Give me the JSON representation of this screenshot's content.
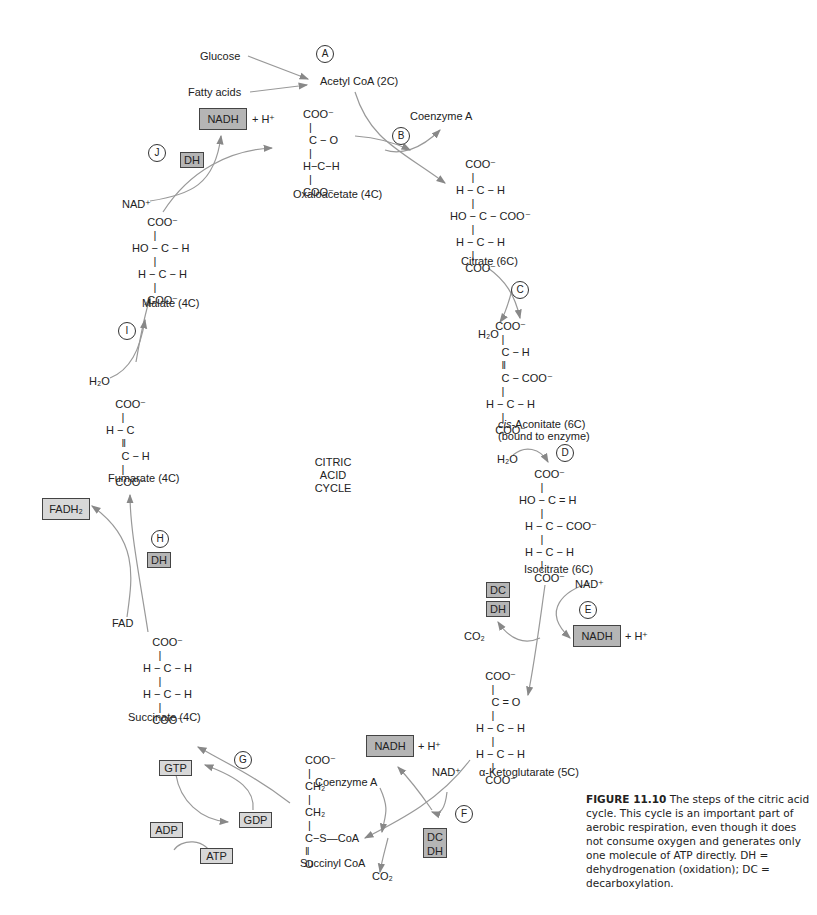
{
  "diagram": {
    "title": "CITRIC ACID CYCLE",
    "title_lines": [
      "CITRIC",
      "ACID",
      "CYCLE"
    ],
    "inputs": {
      "glucose": "Glucose",
      "fatty_acids": "Fatty acids"
    },
    "steps": [
      "A",
      "B",
      "C",
      "D",
      "E",
      "F",
      "G",
      "H",
      "I",
      "J"
    ],
    "molecules": {
      "acetyl_coa": "Acetyl CoA (2C)",
      "oxaloacetate": "Oxaloacetate (4C)",
      "citrate": "Citrate (6C)",
      "cis_aconitate": "-Aconitate (6C)",
      "cis_prefix": "cis",
      "cis_aconitate_note": "(bound to enzyme)",
      "isocitrate": "Isocitrate (6C)",
      "alpha_ketoglutarate": "α-Ketoglutarate (5C)",
      "succinyl_coa": "Succinyl CoA",
      "succinate": "Succinate (4C)",
      "fumarate": "Fumarate (4C)",
      "malate": "Malate (4C)"
    },
    "structures": {
      "oxaloacetate": "COO⁻\n  |\n  C − O\n  |\nH−C−H\n  |\nCOO⁻",
      "citrate": "     COO⁻\n       |\n  H − C − H\n       |\nHO − C − COO⁻\n       |\n  H − C − H\n       |\n     COO⁻",
      "cis_aconitate": "     COO⁻\n       |\n       C − H\n       ‖\n       C − COO⁻\n       |\n  H − C − H\n       |\n     COO⁻",
      "isocitrate": "     COO⁻\n       |\nHO − C = H\n       |\n  H − C − COO⁻\n       |\n  H − C − H\n       |\n     COO⁻",
      "alpha_ketoglutarate": "     COO⁻\n       |\n       C = O\n       |\n  H − C − H\n       |\n  H − C − H\n       |\n     COO⁻",
      "succinyl_coa": "COO⁻\n |\nCH₂\n |\nCH₂\n |\nC−S—CoA\n‖\nO",
      "succinate": "     COO⁻\n       |\n  H − C − H\n       |\n  H − C − H\n       |\n     COO⁻",
      "fumarate": "     COO⁻\n       |\n  H − C\n       ‖\n       C − H\n       |\n     COO⁻",
      "malate": "     COO⁻\n       |\nHO − C − H\n       |\n  H − C − H\n       |\n     COO⁻"
    },
    "cofactors": {
      "coenzyme_a_top": "Coenzyme A",
      "coenzyme_a_bottom": "Coenzyme A",
      "h2o_c": "H₂O",
      "h2o_d": "H₂O",
      "h2o_i": "H₂O",
      "nad_e": "NAD⁺",
      "nad_f": "NAD⁺",
      "nad_j": "NAD⁺",
      "co2_e": "CO₂",
      "co2_f": "CO₂",
      "fad": "FAD",
      "plus_h": "+ H⁺"
    },
    "boxes": {
      "nadh": "NADH",
      "dh": "DH",
      "dc": "DC",
      "fadh2": "FADH₂",
      "gtp": "GTP",
      "gdp": "GDP",
      "adp": "ADP",
      "atp": "ATP"
    },
    "colors": {
      "box_dark": "#b5b5b5",
      "box_light": "#d8d8d8",
      "arrow": "#888888"
    }
  },
  "caption": {
    "label": "FIGURE 11.10",
    "text": "The steps of the citric acid cycle. This cycle is an important part of aerobic respiration, even though it does not consume oxygen and generates only one molecule of ATP directly. DH = dehydrogenation (oxidation); DC = decarboxylation."
  }
}
